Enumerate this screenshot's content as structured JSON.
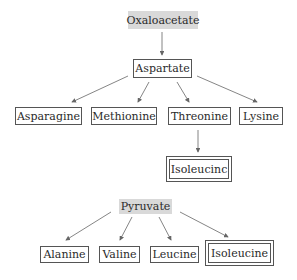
{
  "diagram": {
    "groups": [
      {
        "source": "Oxaloacetate",
        "intermediate": "Aspartate",
        "products": [
          "Asparagine",
          "Methionine",
          "Threonine",
          "Lysine"
        ],
        "threonine_product": "Isoleucinc"
      },
      {
        "source": "Pyruvate",
        "products": [
          "Alanine",
          "Valine",
          "Leucine",
          "Isoleucine"
        ]
      }
    ],
    "nodes": {
      "oxaloacetate": "Oxaloacetate",
      "aspartate": "Aspartate",
      "asparagine": "Asparagine",
      "methionine": "Methionine",
      "threonine": "Threonine",
      "lysine": "Lysine",
      "isoleucine_a": "Isoleucinc",
      "pyruvate": "Pyruvate",
      "alanine": "Alanine",
      "valine": "Valine",
      "leucine": "Leucine",
      "isoleucine_b": "Isoleucine"
    },
    "edges": [
      [
        "Oxaloacetate",
        "Aspartate"
      ],
      [
        "Aspartate",
        "Asparagine"
      ],
      [
        "Aspartate",
        "Methionine"
      ],
      [
        "Aspartate",
        "Threonine"
      ],
      [
        "Aspartate",
        "Lysine"
      ],
      [
        "Threonine",
        "Isoleucinc"
      ],
      [
        "Pyruvate",
        "Alanine"
      ],
      [
        "Pyruvate",
        "Valine"
      ],
      [
        "Pyruvate",
        "Leucine"
      ],
      [
        "Pyruvate",
        "Isoleucine"
      ]
    ],
    "colors": {
      "shaded_fill": "#d9d9d9",
      "border": "#555555",
      "arrow": "#666666"
    }
  }
}
